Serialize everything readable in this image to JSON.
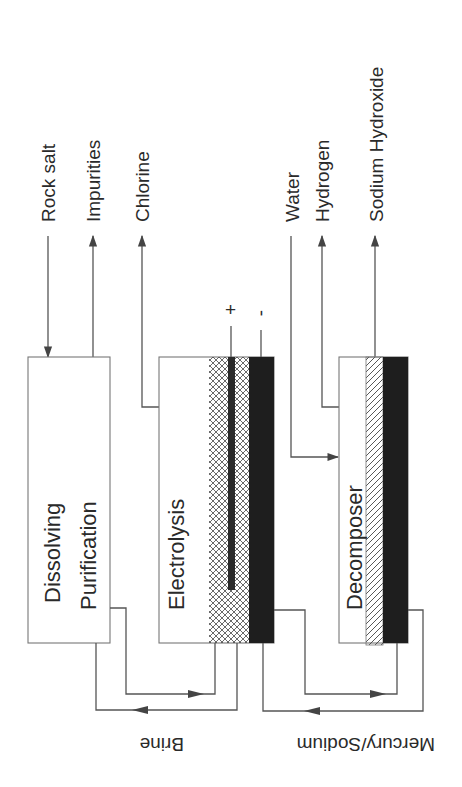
{
  "diagram": {
    "inputs_outputs": {
      "rock_salt": "Rock salt",
      "impurities": "Impurities",
      "chlorine": "Chlorine",
      "water": "Water",
      "hydrogen": "Hydrogen",
      "sodium_hydroxide": "Sodium Hydroxide"
    },
    "units": {
      "dissolving": "Dissolving",
      "purification": "Purification",
      "electrolysis": "Electrolysis",
      "decomposer": "Decomposer"
    },
    "electrodes": {
      "plus": "+",
      "minus": "-"
    },
    "loops": {
      "brine": "Brine",
      "mercury_sodium": "Mercury/Sodium"
    },
    "colors": {
      "line": "#555555",
      "black_layer": "#1e1e1e",
      "box_border": "#777777"
    }
  }
}
